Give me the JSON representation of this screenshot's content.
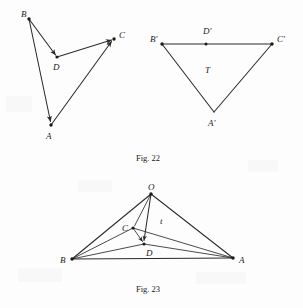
{
  "page": {
    "background_color": "#fdfdfd",
    "ink_color": "#2a2a2a",
    "width": 303,
    "height": 308
  },
  "figures": [
    {
      "id": "fig-22",
      "caption": "Fig. 22",
      "caption_pos": {
        "x": 148,
        "y": 161
      },
      "panels": [
        {
          "id": "fig-22-left",
          "name": "quadrilateral-ABCD",
          "vertices": [
            {
              "label": "B",
              "x": 29,
              "y": 19,
              "label_x": 21,
              "label_y": 17,
              "dot": true
            },
            {
              "label": "D",
              "x": 57,
              "y": 57,
              "label_x": 53,
              "label_y": 70,
              "dot": true
            },
            {
              "label": "C",
              "x": 114,
              "y": 39,
              "label_x": 119,
              "label_y": 38,
              "dot": true
            },
            {
              "label": "A",
              "x": 51,
              "y": 125,
              "label_x": 46,
              "label_y": 139,
              "dot": true
            }
          ],
          "edges": [
            {
              "from": "B",
              "to": "D",
              "arrow": true
            },
            {
              "from": "D",
              "to": "C",
              "arrow": true
            },
            {
              "from": "B",
              "to": "A",
              "arrow": true
            },
            {
              "from": "A",
              "to": "C",
              "arrow": true
            }
          ]
        },
        {
          "id": "fig-22-right",
          "name": "triangle-A-prime-B-prime-C-prime",
          "vertices": [
            {
              "label": "B'",
              "x": 162,
              "y": 44,
              "label_x": 150,
              "label_y": 42,
              "dot": true
            },
            {
              "label": "C'",
              "x": 272,
              "y": 44,
              "label_x": 277,
              "label_y": 42,
              "dot": true
            },
            {
              "label": "A'",
              "x": 214,
              "y": 112,
              "label_x": 208,
              "label_y": 126,
              "dot": false
            }
          ],
          "midpoint": {
            "label": "D'",
            "x": 206,
            "y": 44,
            "label_x": 203,
            "label_y": 34,
            "dot": true
          },
          "interior_label": {
            "label": "T",
            "x": 208,
            "y": 70
          },
          "edges": [
            {
              "from": "B'",
              "to": "C'",
              "arrow": false
            },
            {
              "from": "B'",
              "to": "A'",
              "arrow": false
            },
            {
              "from": "A'",
              "to": "C'",
              "arrow": false
            }
          ]
        }
      ]
    },
    {
      "id": "fig-23",
      "caption": "Fig. 23",
      "caption_pos": {
        "x": 148,
        "y": 292
      },
      "panels": [
        {
          "id": "fig-23-main",
          "name": "tetrahedron-OABCD",
          "vertices": [
            {
              "label": "O",
              "x": 151,
              "y": 194,
              "label_x": 148,
              "label_y": 190,
              "dot": true
            },
            {
              "label": "B",
              "x": 72,
              "y": 259,
              "label_x": 62,
              "label_y": 262,
              "dot": true
            },
            {
              "label": "A",
              "x": 233,
              "y": 258,
              "label_x": 240,
              "label_y": 262,
              "dot": true
            },
            {
              "label": "C",
              "x": 133,
              "y": 228,
              "label_x": 124,
              "label_y": 231,
              "dot": true
            },
            {
              "label": "D",
              "x": 144,
              "y": 244,
              "label_x": 146,
              "label_y": 255,
              "dot": true
            }
          ],
          "vector_label": {
            "label": "t",
            "x": 162,
            "y": 222
          },
          "edges": [
            {
              "from": "O",
              "to": "B",
              "arrow": false
            },
            {
              "from": "O",
              "to": "A",
              "arrow": false
            },
            {
              "from": "B",
              "to": "A",
              "arrow": false
            },
            {
              "from": "O",
              "to": "C",
              "arrow": false
            },
            {
              "from": "O",
              "to": "D",
              "arrow": true
            },
            {
              "from": "C",
              "to": "D",
              "arrow": true
            },
            {
              "from": "B",
              "to": "C",
              "arrow": false
            },
            {
              "from": "B",
              "to": "D",
              "arrow": false
            },
            {
              "from": "D",
              "to": "A",
              "arrow": false
            },
            {
              "from": "C",
              "to": "A",
              "arrow": false
            }
          ]
        }
      ]
    }
  ]
}
